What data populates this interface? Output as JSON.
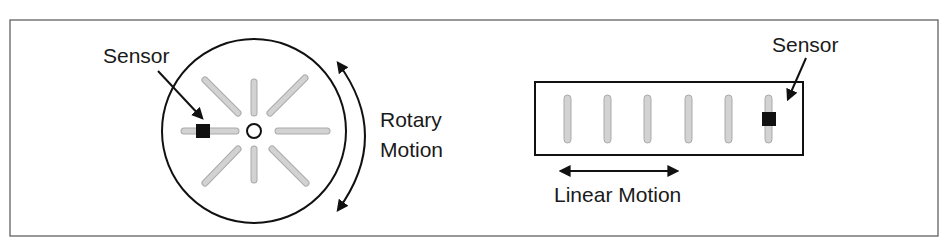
{
  "diagram": {
    "frame": {
      "x": 10,
      "y": 20,
      "width": 928,
      "height": 216,
      "stroke": "#555555"
    },
    "rotary": {
      "wheel": {
        "cx": 254,
        "cy": 131,
        "r": 92
      },
      "hub": {
        "cx": 254,
        "cy": 131,
        "r": 7
      },
      "slot_count": 8,
      "slot_inner": 18,
      "slot_outer": 52,
      "slot_color": "#cfcfcf",
      "sensor_label": "Sensor",
      "sensor_box": {
        "x": 196,
        "y": 124,
        "w": 14,
        "h": 14
      },
      "motion_label_line1": "Rotary",
      "motion_label_line2": "Motion"
    },
    "linear": {
      "strip": {
        "x": 535,
        "y": 82,
        "w": 268,
        "h": 73
      },
      "slot_xs": [
        567,
        607,
        647,
        688,
        728,
        768
      ],
      "slot_y1": 97,
      "slot_y2": 141,
      "sensor_label": "Sensor",
      "sensor_box": {
        "x": 762,
        "y": 112,
        "w": 14,
        "h": 14
      },
      "motion_label": "Linear Motion"
    },
    "colors": {
      "line": "#111111",
      "slot": "#cfcfcf",
      "slot_edge": "#aaaaaa",
      "sensor": "#111111"
    }
  }
}
